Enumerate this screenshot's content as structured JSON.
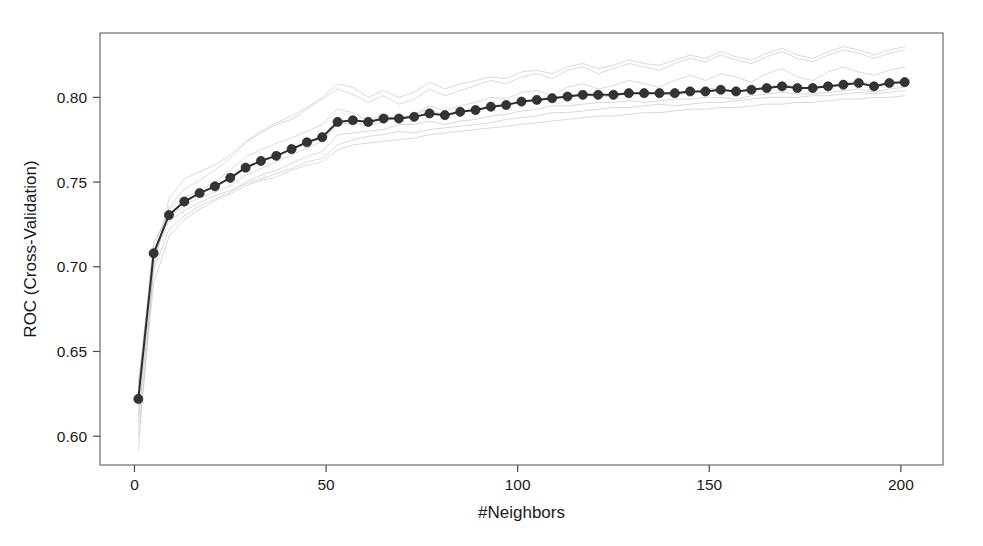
{
  "figure": {
    "width": 983,
    "height": 546,
    "background_color": "#ffffff",
    "panel": {
      "left": 100,
      "top": 33,
      "right": 943,
      "bottom": 465,
      "border_color": "#6b6b6b",
      "fill_color": "#ffffff"
    }
  },
  "axes": {
    "x": {
      "label": "#Neighbors",
      "ticks": [
        0,
        50,
        100,
        150,
        200
      ],
      "tick_labels": [
        "0",
        "50",
        "100",
        "150",
        "200"
      ],
      "range": [
        -9,
        211
      ],
      "pixel_zero": 133,
      "pixel_per_unit": 3.845
    },
    "y": {
      "label": "ROC (Cross-Validation)",
      "ticks": [
        0.6,
        0.65,
        0.7,
        0.75,
        0.8
      ],
      "tick_labels": [
        "0.60",
        "0.65",
        "0.70",
        "0.75",
        "0.80"
      ],
      "range": [
        0.583,
        0.838
      ],
      "pixel_at_080": 108,
      "pixel_per_unit": 1645
    }
  },
  "style": {
    "mean_line_color": "#2e2e2e",
    "mean_marker_color": "#343434",
    "fold_line_color": "#b9b9b9",
    "tick_color": "#4a4a4a",
    "text_color": "#1a1a1a"
  },
  "chart_data": {
    "type": "line",
    "title": "",
    "subtitle": "",
    "xlabel": "#Neighbors",
    "ylabel": "ROC (Cross-Validation)",
    "xlim": [
      -9,
      211
    ],
    "ylim": [
      0.583,
      0.838
    ],
    "grid": false,
    "legend": false,
    "legend_position": "none",
    "annotations": [],
    "x": [
      1,
      5,
      9,
      13,
      17,
      21,
      25,
      29,
      33,
      37,
      41,
      45,
      49,
      53,
      57,
      61,
      65,
      69,
      73,
      77,
      81,
      85,
      89,
      93,
      97,
      101,
      105,
      109,
      113,
      117,
      121,
      125,
      129,
      133,
      137,
      141,
      145,
      149,
      153,
      157,
      161,
      165,
      169,
      173,
      177,
      181,
      185,
      189,
      193,
      197,
      201
    ],
    "series": [
      {
        "name": "Mean ROC (cross-validated)",
        "role": "mean",
        "marker": "circle",
        "color": "#2e2e2e",
        "values": [
          0.622,
          0.708,
          0.7305,
          0.7385,
          0.7435,
          0.7475,
          0.7525,
          0.7585,
          0.7625,
          0.7655,
          0.7695,
          0.7735,
          0.7765,
          0.7855,
          0.7865,
          0.7855,
          0.7875,
          0.7875,
          0.7885,
          0.7905,
          0.7895,
          0.7915,
          0.7925,
          0.7945,
          0.7955,
          0.7975,
          0.7985,
          0.7995,
          0.8005,
          0.8015,
          0.8015,
          0.8015,
          0.8025,
          0.8025,
          0.8025,
          0.8025,
          0.8035,
          0.8035,
          0.8045,
          0.8035,
          0.8045,
          0.8055,
          0.8065,
          0.8055,
          0.8055,
          0.8065,
          0.8075,
          0.8085,
          0.8065,
          0.8085,
          0.809
        ]
      },
      {
        "name": "Resample 1",
        "role": "fold",
        "color": "#b9b9b9",
        "values": [
          0.612,
          0.702,
          0.735,
          0.746,
          0.751,
          0.757,
          0.764,
          0.773,
          0.779,
          0.784,
          0.787,
          0.793,
          0.799,
          0.805,
          0.802,
          0.797,
          0.801,
          0.796,
          0.799,
          0.805,
          0.801,
          0.804,
          0.807,
          0.81,
          0.808,
          0.812,
          0.814,
          0.811,
          0.816,
          0.818,
          0.814,
          0.817,
          0.82,
          0.818,
          0.816,
          0.82,
          0.823,
          0.821,
          0.825,
          0.822,
          0.82,
          0.824,
          0.827,
          0.823,
          0.821,
          0.825,
          0.828,
          0.826,
          0.823,
          0.826,
          0.828
        ]
      },
      {
        "name": "Resample 2",
        "role": "fold",
        "color": "#b9b9b9",
        "values": [
          0.618,
          0.712,
          0.734,
          0.741,
          0.745,
          0.75,
          0.757,
          0.765,
          0.769,
          0.773,
          0.776,
          0.78,
          0.784,
          0.793,
          0.791,
          0.786,
          0.79,
          0.787,
          0.79,
          0.795,
          0.792,
          0.795,
          0.797,
          0.8,
          0.799,
          0.803,
          0.804,
          0.801,
          0.806,
          0.808,
          0.805,
          0.807,
          0.81,
          0.808,
          0.806,
          0.81,
          0.813,
          0.81,
          0.814,
          0.812,
          0.809,
          0.814,
          0.817,
          0.812,
          0.81,
          0.815,
          0.818,
          0.815,
          0.813,
          0.816,
          0.818
        ]
      },
      {
        "name": "Resample 3",
        "role": "fold",
        "color": "#b9b9b9",
        "values": [
          0.628,
          0.715,
          0.729,
          0.736,
          0.741,
          0.744,
          0.748,
          0.754,
          0.758,
          0.762,
          0.766,
          0.77,
          0.774,
          0.784,
          0.785,
          0.783,
          0.786,
          0.788,
          0.79,
          0.793,
          0.789,
          0.792,
          0.792,
          0.794,
          0.796,
          0.797,
          0.799,
          0.8,
          0.801,
          0.802,
          0.8,
          0.801,
          0.802,
          0.803,
          0.802,
          0.801,
          0.803,
          0.805,
          0.805,
          0.803,
          0.805,
          0.806,
          0.808,
          0.806,
          0.806,
          0.807,
          0.808,
          0.81,
          0.807,
          0.809,
          0.81
        ]
      },
      {
        "name": "Resample 4",
        "role": "fold",
        "color": "#b9b9b9",
        "values": [
          0.608,
          0.698,
          0.722,
          0.73,
          0.736,
          0.74,
          0.744,
          0.75,
          0.754,
          0.757,
          0.761,
          0.765,
          0.768,
          0.778,
          0.779,
          0.78,
          0.781,
          0.784,
          0.784,
          0.786,
          0.784,
          0.786,
          0.787,
          0.789,
          0.79,
          0.792,
          0.793,
          0.795,
          0.795,
          0.796,
          0.797,
          0.797,
          0.798,
          0.797,
          0.798,
          0.799,
          0.799,
          0.8,
          0.8,
          0.799,
          0.801,
          0.802,
          0.803,
          0.802,
          0.802,
          0.803,
          0.804,
          0.805,
          0.803,
          0.805,
          0.806
        ]
      },
      {
        "name": "Resample 5",
        "role": "fold",
        "color": "#b9b9b9",
        "values": [
          0.632,
          0.706,
          0.727,
          0.733,
          0.738,
          0.742,
          0.745,
          0.749,
          0.752,
          0.755,
          0.758,
          0.762,
          0.764,
          0.772,
          0.775,
          0.777,
          0.778,
          0.78,
          0.779,
          0.781,
          0.782,
          0.783,
          0.784,
          0.785,
          0.787,
          0.788,
          0.789,
          0.791,
          0.791,
          0.792,
          0.793,
          0.794,
          0.794,
          0.795,
          0.796,
          0.795,
          0.796,
          0.797,
          0.797,
          0.798,
          0.799,
          0.8,
          0.8,
          0.8,
          0.801,
          0.801,
          0.802,
          0.803,
          0.802,
          0.803,
          0.804
        ]
      },
      {
        "name": "Resample 6",
        "role": "fold",
        "color": "#b9b9b9",
        "values": [
          0.6,
          0.69,
          0.718,
          0.728,
          0.734,
          0.739,
          0.743,
          0.748,
          0.751,
          0.753,
          0.757,
          0.76,
          0.762,
          0.769,
          0.772,
          0.773,
          0.774,
          0.775,
          0.776,
          0.778,
          0.779,
          0.78,
          0.781,
          0.782,
          0.783,
          0.784,
          0.785,
          0.786,
          0.787,
          0.788,
          0.789,
          0.789,
          0.79,
          0.791,
          0.791,
          0.792,
          0.793,
          0.793,
          0.794,
          0.794,
          0.795,
          0.796,
          0.796,
          0.797,
          0.797,
          0.798,
          0.799,
          0.799,
          0.8,
          0.8,
          0.801
        ]
      },
      {
        "name": "Resample 7",
        "role": "fold",
        "color": "#b9b9b9",
        "values": [
          0.592,
          0.7,
          0.74,
          0.752,
          0.756,
          0.76,
          0.766,
          0.774,
          0.78,
          0.785,
          0.789,
          0.794,
          0.8,
          0.808,
          0.806,
          0.8,
          0.804,
          0.8,
          0.803,
          0.809,
          0.805,
          0.808,
          0.81,
          0.812,
          0.811,
          0.815,
          0.816,
          0.814,
          0.818,
          0.82,
          0.817,
          0.819,
          0.822,
          0.82,
          0.819,
          0.822,
          0.825,
          0.823,
          0.827,
          0.824,
          0.822,
          0.826,
          0.829,
          0.825,
          0.823,
          0.827,
          0.83,
          0.828,
          0.825,
          0.828,
          0.83
        ]
      }
    ]
  }
}
